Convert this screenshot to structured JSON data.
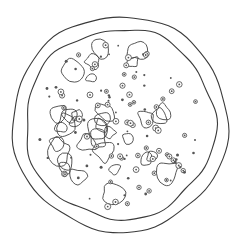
{
  "illustration": {
    "subject": "pizza line art",
    "colors": {
      "background": "#ffffff",
      "ink": "#3a3a3a"
    },
    "center": [
      120,
      124
    ],
    "outer_crust_radius": 108,
    "inner_crust_radius": 95,
    "cheese_radius": 88
  }
}
